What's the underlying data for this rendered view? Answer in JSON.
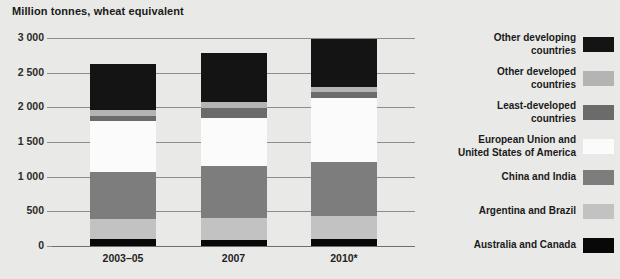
{
  "chart_data": {
    "type": "bar",
    "subtype": "stacked-vertical",
    "title": "Million tonnes, wheat equivalent",
    "xlabel": "",
    "ylabel": "Million tonnes, wheat equivalent",
    "ylim": [
      0,
      3000
    ],
    "ytick_step": 500,
    "ytick_labels": [
      "3 000",
      "2 500",
      "2 000",
      "1 500",
      "1 000",
      "500",
      "0"
    ],
    "ytick_values": [
      3000,
      2500,
      2000,
      1500,
      1000,
      500,
      0
    ],
    "grid": true,
    "legend_position": "right",
    "categories": [
      "2003–05",
      "2007",
      "2010*"
    ],
    "series": [
      {
        "name": "Australia and Canada",
        "color": "#080808",
        "values": [
          100,
          85,
          105
        ]
      },
      {
        "name": "Argentina and Brazil",
        "color": "#c2c2c2",
        "values": [
          290,
          315,
          335
        ]
      },
      {
        "name": "China and India",
        "color": "#7d7d7d",
        "values": [
          675,
          755,
          775
        ]
      },
      {
        "name": "European Union and\nUnited States of America",
        "color": "#fbfbfb",
        "values": [
          735,
          690,
          920
        ]
      },
      {
        "name": "Least-developed\ncountries",
        "color": "#6b6b6b",
        "values": [
          80,
          145,
          80
        ]
      },
      {
        "name": "Other developed\ncountries",
        "color": "#b4b4b4",
        "values": [
          80,
          85,
          85
        ]
      },
      {
        "name": "Other developing\ncountries",
        "color": "#141414",
        "values": [
          660,
          710,
          690
        ]
      }
    ],
    "totals": [
      2620,
      2785,
      2990
    ],
    "legend_order_top_to_bottom": [
      "Other developing\ncountries",
      "Other developed\ncountries",
      "Least-developed\ncountries",
      "European Union and\nUnited States of America",
      "China and India",
      "Argentina and Brazil",
      "Australia and Canada"
    ]
  },
  "legend": {
    "items": [
      {
        "label": "Other developing\ncountries",
        "color": "#141414"
      },
      {
        "label": "Other developed\ncountries",
        "color": "#b4b4b4"
      },
      {
        "label": "Least-developed\ncountries",
        "color": "#6b6b6b"
      },
      {
        "label": "European Union and\nUnited States of America",
        "color": "#fbfbfb"
      },
      {
        "label": "China and India",
        "color": "#7d7d7d"
      },
      {
        "label": "Argentina and Brazil",
        "color": "#c2c2c2"
      },
      {
        "label": "Australia and Canada",
        "color": "#080808"
      }
    ]
  },
  "colors": {
    "background": "#e9e9e7",
    "gridline": "#8d8d8d",
    "text": "#1a1a1a"
  }
}
